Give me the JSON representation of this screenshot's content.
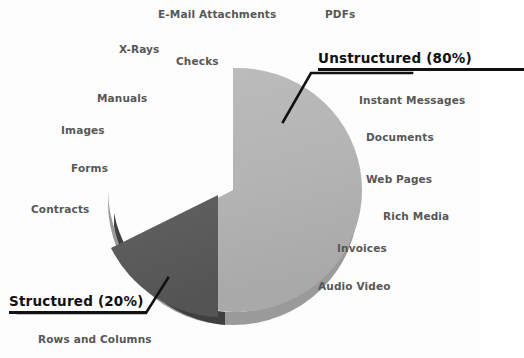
{
  "chart_data": {
    "type": "pie",
    "title": "",
    "subtitle": "",
    "xlabel": "",
    "ylabel": "",
    "grid": false,
    "legend_position": "none",
    "three_d": true,
    "exploded_slice": "Structured",
    "categories": [
      "Unstructured",
      "Structured"
    ],
    "values": [
      80,
      20
    ],
    "units": "percent",
    "slices": [
      {
        "name": "Unstructured",
        "value": 80,
        "label": "Unstructured  (80%)",
        "color": "#b4b4b4",
        "side_color": "#9a9a9a",
        "examples": [
          "E-Mail Attachments",
          "PDFs",
          "X-Rays",
          "Checks",
          "Manuals",
          "Images",
          "Forms",
          "Contracts",
          "Instant Messages",
          "Documents",
          "Web Pages",
          "Rich Media",
          "Invoices",
          "Audio Video"
        ]
      },
      {
        "name": "Structured",
        "value": 20,
        "label": "Structured  (20%)",
        "color": "#595959",
        "side_color": "#4a4a4a",
        "examples": [
          "Rows and Columns"
        ]
      }
    ]
  },
  "callouts": {
    "unstructured": {
      "text": "Unstructured  (80%)"
    },
    "structured": {
      "text": "Structured  (20%)"
    }
  },
  "labels": {
    "email_attachments": "E-Mail Attachments",
    "pdfs": "PDFs",
    "xrays": "X-Rays",
    "checks": "Checks",
    "manuals": "Manuals",
    "images": "Images",
    "forms": "Forms",
    "contracts": "Contracts",
    "instant_messages": "Instant Messages",
    "documents": "Documents",
    "web_pages": "Web Pages",
    "rich_media": "Rich Media",
    "invoices": "Invoices",
    "audio_video": "Audio Video",
    "rows_and_columns": "Rows and Columns"
  },
  "colors": {
    "unstructured_slice": "#b4b4b4",
    "structured_slice": "#595959",
    "label_text": "#575757",
    "callout_text": "#111111",
    "background": "#fdfdfd"
  }
}
